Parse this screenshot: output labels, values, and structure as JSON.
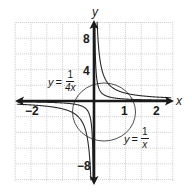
{
  "chart_data": {
    "type": "line",
    "title": "",
    "xlabel": "x",
    "ylabel": "y",
    "xlim": [
      -2.5,
      2.5
    ],
    "ylim": [
      -10,
      10
    ],
    "grid": true,
    "grid_spacing": {
      "x": 0.5,
      "y": 2
    },
    "x_tick_labels": [
      {
        "value": -2,
        "label": "−2"
      },
      {
        "value": 1,
        "label": "1"
      },
      {
        "value": 2,
        "label": "2"
      }
    ],
    "y_tick_labels": [
      {
        "value": 8,
        "label": "8"
      },
      {
        "value": 4,
        "label": "4"
      },
      {
        "value": -8,
        "label": "−8"
      }
    ],
    "series": [
      {
        "name": "y = 1/x",
        "function": "1/x",
        "x": [
          -2,
          -1,
          -0.5,
          -0.25,
          -0.125,
          0.125,
          0.25,
          0.5,
          1,
          2
        ],
        "values": [
          -0.5,
          -1,
          -2,
          -4,
          -8,
          8,
          4,
          2,
          1,
          0.5
        ]
      },
      {
        "name": "y = 1/(4x)",
        "function": "1/(4x)",
        "x": [
          -2,
          -1,
          -0.5,
          -0.25,
          -0.125,
          -0.03125,
          0.03125,
          0.125,
          0.25,
          0.5,
          1,
          2
        ],
        "values": [
          -0.125,
          -0.25,
          -0.5,
          -1,
          -2,
          -8,
          8,
          2,
          1,
          0.5,
          0.25,
          0.125
        ]
      }
    ],
    "annotations": [
      {
        "text": "y = 1/(4x)",
        "position": "upper-left of origin"
      },
      {
        "text": "y = 1/x",
        "position": "lower-right of origin"
      },
      {
        "type": "circle",
        "description": "circle highlighting region near origin"
      }
    ]
  },
  "labels": {
    "x_axis": "x",
    "y_axis": "y",
    "tick_x_neg2": "−2",
    "tick_x_1": "1",
    "tick_x_2": "2",
    "tick_y_8": "8",
    "tick_y_4": "4",
    "tick_y_neg8": "−8",
    "eq_quarter": {
      "var": "y",
      "equals": "=",
      "num": "1",
      "den": "4x"
    },
    "eq_recip": {
      "var": "y",
      "equals": "=",
      "num": "1",
      "den": "x"
    }
  }
}
